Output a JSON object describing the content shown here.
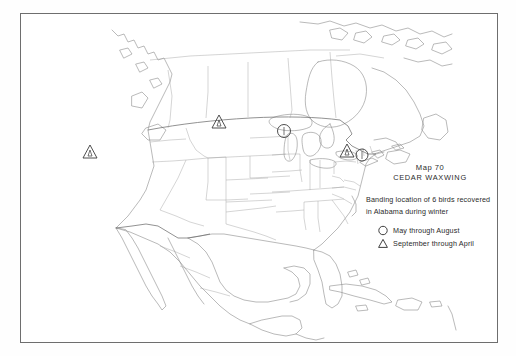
{
  "map": {
    "frame": {
      "x": 20,
      "y": 13,
      "w": 478,
      "h": 330,
      "stroke": "#6e6e6e"
    },
    "region": "North America",
    "outline_color": "#8c8c8c",
    "boundary_color": "#9a9a9a",
    "symbol_color": "#3a3a3a",
    "background": "#ffffff"
  },
  "legend": {
    "title": "Map 70",
    "subtitle": "CEDAR WAXWING",
    "description_line1": "Banding location of 6 birds recovered",
    "description_line2": "in Alabama during winter",
    "entries": [
      {
        "symbol": "circle",
        "label": "May through August"
      },
      {
        "symbol": "triangle",
        "label": "September through April"
      }
    ]
  },
  "markers": [
    {
      "id": "m1",
      "symbol": "triangle",
      "x": 90,
      "y": 152,
      "region": "Nevada / eastern California"
    },
    {
      "id": "m2",
      "symbol": "triangle",
      "x": 219,
      "y": 122,
      "region": "North Dakota / Minnesota"
    },
    {
      "id": "m3",
      "symbol": "circle",
      "x": 284,
      "y": 131,
      "region": "Wisconsin / Michigan"
    },
    {
      "id": "m4",
      "symbol": "triangle",
      "x": 347,
      "y": 151,
      "region": "New England"
    },
    {
      "id": "m5",
      "symbol": "circle",
      "x": 361,
      "y": 155,
      "region": "Massachusetts coast"
    }
  ]
}
